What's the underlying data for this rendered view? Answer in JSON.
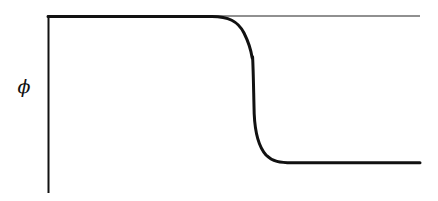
{
  "figure": {
    "background_color": "#ffffff",
    "line_color": "#111111",
    "width": 438,
    "height": 201
  },
  "axis": {
    "y_axis_label": "ϕ",
    "y_axis_label_name": "phi",
    "y_axis_x": 48,
    "y_axis_top": 15,
    "y_axis_bottom": 193,
    "y_axis_stroke_width": 2,
    "x_axis_visible": false,
    "ticks": [],
    "tick_labels": [],
    "grid": false
  },
  "chart_data": {
    "type": "line",
    "title": "",
    "subtitle": "",
    "xlabel": "",
    "ylabel": "ϕ",
    "xlim": [
      0,
      1
    ],
    "ylim": [
      0,
      1
    ],
    "grid": false,
    "legend": null,
    "legend_position": "none",
    "annotations": [],
    "series": [
      {
        "name": "asymptote",
        "style": "thin-solid",
        "stroke_width": 1,
        "color": "#222222",
        "description": "thin horizontal reference line at the upper plateau value",
        "x": [
          0.0,
          1.0
        ],
        "values": [
          1.0,
          1.0
        ]
      },
      {
        "name": "kink-profile",
        "style": "thick-solid",
        "stroke_width": 3,
        "color": "#111111",
        "description": "smooth step (kink / domain wall) profile dropping from the upper plateau to the lower plateau",
        "x": [
          0.0,
          0.08,
          0.16,
          0.24,
          0.32,
          0.4,
          0.44,
          0.47,
          0.49,
          0.505,
          0.52,
          0.535,
          0.55,
          0.57,
          0.6,
          0.64,
          0.7,
          0.78,
          0.86,
          0.94,
          1.0
        ],
        "values": [
          1.0,
          1.0,
          1.0,
          1.0,
          1.0,
          0.99,
          0.96,
          0.88,
          0.75,
          0.62,
          0.48,
          0.34,
          0.22,
          0.13,
          0.07,
          0.035,
          0.015,
          0.005,
          0.0,
          0.0,
          0.0
        ]
      }
    ],
    "plateau_upper_value": 1.0,
    "plateau_lower_value": 0.0,
    "transition_center_x": 0.515
  },
  "geometry": {
    "thin_line_y": 16,
    "thin_line_x_start": 48,
    "thin_line_x_end": 420,
    "curve_top_y": 16,
    "curve_bottom_y": 163,
    "curve_x_start": 48,
    "curve_x_end": 420,
    "curve_bend_start_x": 222,
    "curve_steep_x": 252,
    "curve_bend_end_x": 292,
    "kink_x": 253,
    "kink_y": 57,
    "phi_label_x": 24,
    "phi_label_y": 93
  }
}
